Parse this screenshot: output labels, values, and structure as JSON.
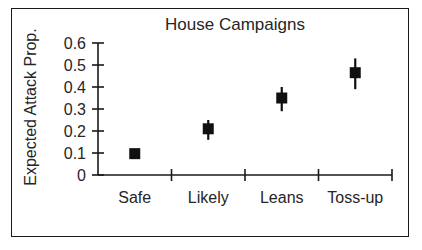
{
  "chart_data": {
    "type": "scatter",
    "title": "House Campaigns",
    "xlabel": "",
    "ylabel": "Expected Attack Prop.",
    "categories": [
      "Safe",
      "Likely",
      "Leans",
      "Toss-up"
    ],
    "values": [
      0.097,
      0.21,
      0.35,
      0.465
    ],
    "error_low": [
      0.08,
      0.16,
      0.29,
      0.39
    ],
    "error_high": [
      0.112,
      0.25,
      0.4,
      0.53
    ],
    "ylim": [
      0,
      0.6
    ],
    "yticks": [
      0,
      0.1,
      0.2,
      0.3,
      0.4,
      0.5,
      0.6
    ],
    "ytick_labels": [
      "0",
      "0.1",
      "0.2",
      "0.3",
      "0.4",
      "0.5",
      "0.6"
    ],
    "grid": false,
    "legend": "none",
    "marker": "filled-square",
    "series": [
      {
        "name": "Expected Attack Prop.",
        "points": [
          {
            "category": "Safe",
            "value": 0.097,
            "ci_low": 0.08,
            "ci_high": 0.112
          },
          {
            "category": "Likely",
            "value": 0.21,
            "ci_low": 0.16,
            "ci_high": 0.25
          },
          {
            "category": "Leans",
            "value": 0.35,
            "ci_low": 0.29,
            "ci_high": 0.4
          },
          {
            "category": "Toss-up",
            "value": 0.465,
            "ci_low": 0.39,
            "ci_high": 0.53
          }
        ]
      }
    ],
    "colors": {
      "marker": "#101010",
      "axis": "#1a1a1a",
      "text": "#262626",
      "background": "#ffffff"
    }
  }
}
